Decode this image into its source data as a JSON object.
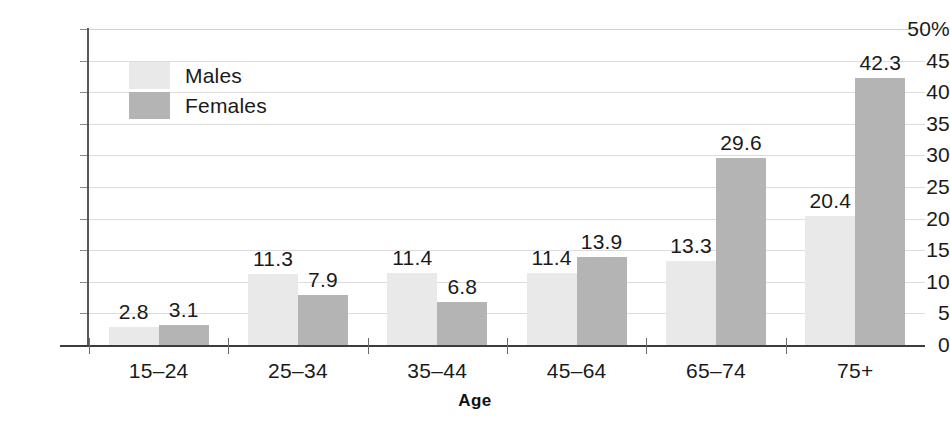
{
  "chart_data": {
    "type": "bar",
    "title": "",
    "subtitle": "",
    "xlabel": "Age",
    "ylabel": "",
    "categories": [
      "15–24",
      "25–34",
      "35–44",
      "45–64",
      "65–74",
      "75+"
    ],
    "series": [
      {
        "name": "Males",
        "color": "#e9e9e9",
        "values": [
          2.8,
          11.3,
          11.4,
          11.4,
          13.3,
          20.4
        ]
      },
      {
        "name": "Females",
        "color": "#b4b4b4",
        "values": [
          3.1,
          7.9,
          6.8,
          13.9,
          29.6,
          42.3
        ]
      }
    ],
    "ylim": [
      0,
      50
    ],
    "ytick_values": [
      0,
      5,
      10,
      15,
      20,
      25,
      30,
      35,
      40,
      45,
      50
    ],
    "ytick_labels": [
      "0",
      "5",
      "10",
      "15",
      "20",
      "25",
      "30",
      "35",
      "40",
      "45",
      "50%"
    ],
    "grid": true,
    "grid_axis": "y",
    "legend_position": "top-left-inside",
    "value_labels": true,
    "axis_color": "#59595b",
    "grid_color": "#dcdcdc",
    "background": "#ffffff"
  }
}
